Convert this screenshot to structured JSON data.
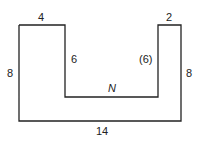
{
  "diagram": {
    "shape": "U-shaped polygon",
    "labels": {
      "top_left": "4",
      "top_right": "2",
      "left": "8",
      "right": "8",
      "inner_left": "6",
      "inner_right": "(6)",
      "inner_bottom": "N",
      "bottom": "14"
    },
    "stroke_color": "#222222"
  }
}
